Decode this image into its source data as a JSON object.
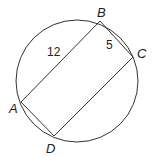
{
  "diagram": {
    "circle": {
      "cx": 77,
      "cy": 81,
      "r": 61
    },
    "points": [
      {
        "name": "A",
        "x": 21,
        "y": 102,
        "label_x": 9,
        "label_y": 113
      },
      {
        "name": "B",
        "x": 100,
        "y": 21,
        "label_x": 97,
        "label_y": 17
      },
      {
        "name": "C",
        "x": 133,
        "y": 57,
        "label_x": 137,
        "label_y": 58
      },
      {
        "name": "D",
        "x": 54,
        "y": 136,
        "label_x": 46,
        "label_y": 153
      }
    ],
    "segments": [
      {
        "from": "A",
        "to": "B",
        "length_label": "12",
        "label_x": 47,
        "label_y": 56
      },
      {
        "from": "B",
        "to": "C",
        "length_label": "5",
        "label_x": 106,
        "label_y": 49
      },
      {
        "from": "C",
        "to": "D",
        "length_label": ""
      },
      {
        "from": "D",
        "to": "A",
        "length_label": ""
      }
    ]
  },
  "labels": {
    "A": "A",
    "B": "B",
    "C": "C",
    "D": "D",
    "AB": "12",
    "BC": "5"
  }
}
